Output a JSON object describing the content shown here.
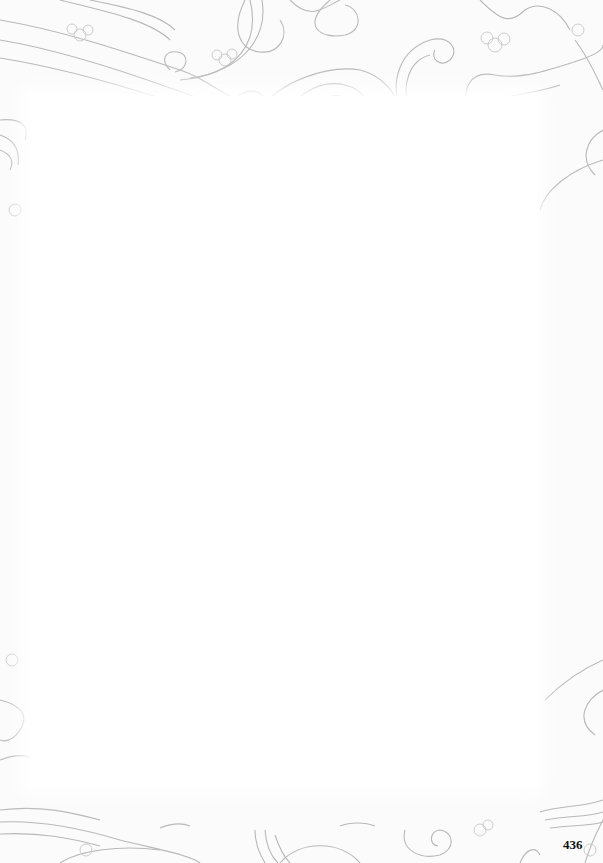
{
  "page": {
    "number": "436",
    "background": "#ffffff",
    "border_style": "decorative swirls and blossoms",
    "ornament_color": "#b5b5b5"
  }
}
